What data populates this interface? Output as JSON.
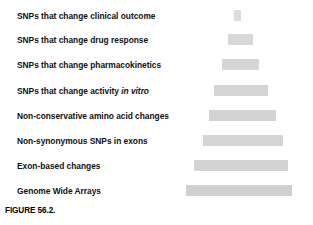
{
  "figure": {
    "caption": "FIGURE 56.2.",
    "bar_color": "#d3d3d3",
    "text_color": "#111111",
    "background": "#ffffff"
  },
  "rows": [
    {
      "label_prefix": "SNPs that change clinical outcome",
      "label_italic": "",
      "label_suffix": ""
    },
    {
      "label_prefix": "SNPs that change drug response",
      "label_italic": "",
      "label_suffix": ""
    },
    {
      "label_prefix": "SNPs that change pharmacokinetics",
      "label_italic": "",
      "label_suffix": ""
    },
    {
      "label_prefix": "SNPs that change activity ",
      "label_italic": "in vitro",
      "label_suffix": ""
    },
    {
      "label_prefix": "Non-conservative amino acid changes",
      "label_italic": "",
      "label_suffix": ""
    },
    {
      "label_prefix": "Non-synonymous SNPs in exons",
      "label_italic": "",
      "label_suffix": ""
    },
    {
      "label_prefix": "Exon-based changes",
      "label_italic": "",
      "label_suffix": ""
    },
    {
      "label_prefix": "Genome Wide Arrays",
      "label_italic": "",
      "label_suffix": ""
    }
  ],
  "chart_data": {
    "type": "bar",
    "title": "FIGURE 56.2.",
    "orientation": "horizontal",
    "grid": false,
    "legend": "none",
    "xlabel": "",
    "ylabel": "",
    "categories": [
      "SNPs that change clinical outcome",
      "SNPs that change drug response",
      "SNPs that change pharmacokinetics",
      "SNPs that change activity in vitro",
      "Non-conservative amino acid changes",
      "Non-synonymous SNPs in exons",
      "Exon-based changes",
      "Genome Wide Arrays"
    ],
    "values": [
      7,
      25,
      37,
      54,
      67,
      80,
      94,
      106
    ],
    "value_units": "relative bar width (px)",
    "bar_centers": [
      237.5,
      240.5,
      240.5,
      241,
      242.5,
      243,
      241,
      239
    ],
    "xlim": [
      0,
      313
    ]
  }
}
